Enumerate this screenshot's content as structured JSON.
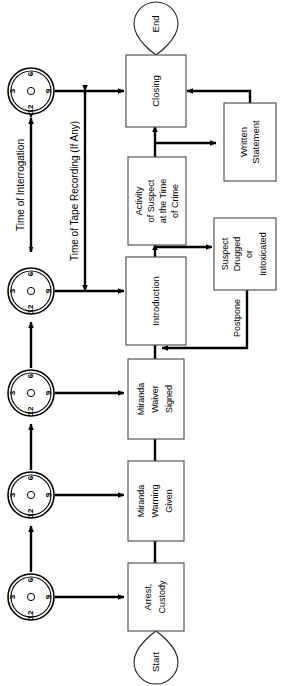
{
  "diagram": {
    "orientation": "rotated-90-ccw",
    "nodes": {
      "start": {
        "label": "Start",
        "shape": "teardrop"
      },
      "end": {
        "label": "End",
        "shape": "teardrop"
      },
      "arrest": {
        "label": "Arrest, Custody",
        "lines": [
          "Arrest,",
          "Custody"
        ]
      },
      "warning": {
        "label": "Miranda Warning Given",
        "lines": [
          "Miranda",
          "Warning",
          "Given"
        ]
      },
      "waiver": {
        "label": "Miranda Waiver Signed",
        "lines": [
          "Miranda",
          "Waiver",
          "Signed"
        ]
      },
      "introduction": {
        "label": "Introduction",
        "lines": [
          "Introduction"
        ]
      },
      "activity": {
        "label": "Activity of Suspect at the Time of Crime",
        "lines": [
          "Activity",
          "of Suspect",
          "at the Time",
          "of Crime"
        ]
      },
      "drugged": {
        "label": "Suspect Drugged or Intoxicated",
        "lines": [
          "Suspect",
          "Drugged",
          "or",
          "Intoxicated"
        ]
      },
      "closing": {
        "label": "Closing",
        "lines": [
          "Closing"
        ]
      },
      "written": {
        "label": "Written Statement",
        "lines": [
          "Written",
          "Statement"
        ]
      }
    },
    "edge_labels": {
      "postpone": "Postpone"
    },
    "axis_labels": {
      "interrogation": "Time of Interrogation",
      "tape": "Time of Tape Recording (If Any)"
    },
    "clock": {
      "name": "clock-icon",
      "numerals": [
        "12",
        "3",
        "6",
        "9"
      ],
      "count": 5
    },
    "colors": {
      "line": "#000000",
      "box_stroke": "#555555",
      "background": "#ffffff",
      "text": "#000000"
    }
  }
}
